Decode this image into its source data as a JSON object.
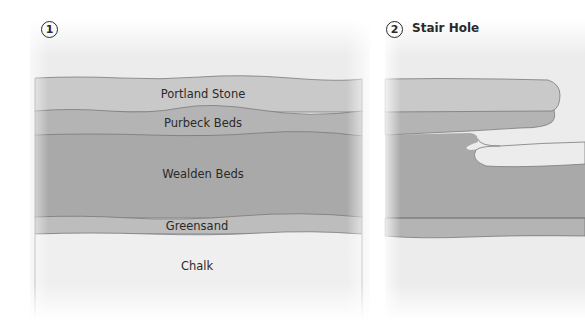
{
  "panels": [
    {
      "number": "1",
      "title": "",
      "layers": [
        {
          "name": "Portland Stone",
          "color": "#c9c9c9"
        },
        {
          "name": "Purbeck Beds",
          "color": "#b4b4b4"
        },
        {
          "name": "Wealden Beds",
          "color": "#a9a9a9"
        },
        {
          "name": "Greensand",
          "color": "#bdbdbd"
        },
        {
          "name": "Chalk",
          "color": "#efefef"
        }
      ]
    },
    {
      "number": "2",
      "title": "Stair Hole",
      "layers": []
    }
  ],
  "colors": {
    "background": "#ffffff",
    "sky": "#ececec",
    "outline": "#7a7a7a",
    "text": "#2a2a2a"
  }
}
